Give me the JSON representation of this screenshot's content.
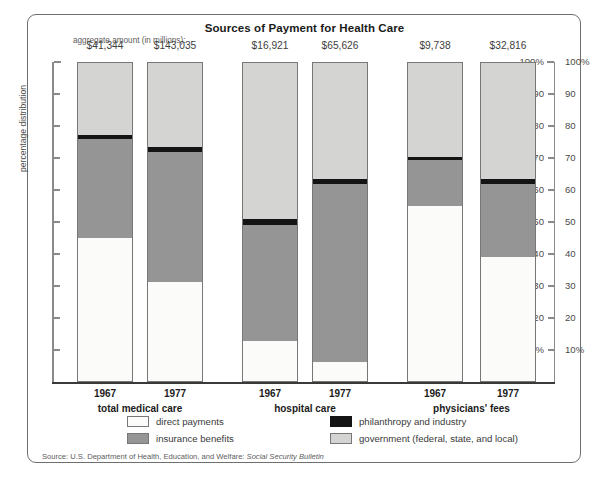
{
  "chart": {
    "title": "Sources of Payment for Health Care",
    "aggregate_label": "aggregate amount (in millions):",
    "ylabel": "percentage distribution",
    "source_prefix": "Source: U.S. Department of Health, Education, and Welfare: ",
    "source_italic": "Social Security Bulletin"
  },
  "axis": {
    "ticks": [
      "100%",
      "90",
      "80",
      "70",
      "60",
      "50",
      "40",
      "30",
      "20",
      "10%"
    ]
  },
  "groups": [
    {
      "name": "total medical care",
      "years": [
        "1967",
        "1977"
      ]
    },
    {
      "name": "hospital care",
      "years": [
        "1967",
        "1977"
      ]
    },
    {
      "name": "physicians' fees",
      "years": [
        "1967",
        "1977"
      ]
    }
  ],
  "legend": [
    {
      "key": "direct",
      "label": "direct payments",
      "color": "#fbfbfa"
    },
    {
      "key": "insurance",
      "label": "insurance benefits",
      "color": "#959595"
    },
    {
      "key": "phil",
      "label": "philanthropy and industry",
      "color": "#141414"
    },
    {
      "key": "gov",
      "label": "government (federal, state, and local)",
      "color": "#d4d4d2"
    }
  ],
  "chart_data": {
    "type": "bar",
    "subtype": "stacked-percentage",
    "title": "Sources of Payment for Health Care",
    "xlabel": "",
    "ylabel": "percentage distribution",
    "ylim": [
      0,
      100
    ],
    "ytick_labels": [
      "10%",
      "20",
      "30",
      "40",
      "50",
      "60",
      "70",
      "80",
      "90",
      "100%"
    ],
    "grid": false,
    "legend_position": "bottom",
    "categories": [
      "total medical care 1967",
      "total medical care 1977",
      "hospital care 1967",
      "hospital care 1977",
      "physicians' fees 1967",
      "physicians' fees 1977"
    ],
    "aggregate_amounts": [
      "$41,344",
      "$143,035",
      "$16,921",
      "$65,626",
      "$9,738",
      "$32,816"
    ],
    "series": [
      {
        "name": "direct payments",
        "values": [
          45.0,
          31.0,
          12.5,
          6.0,
          55.0,
          39.0
        ]
      },
      {
        "name": "insurance benefits",
        "values": [
          31.0,
          41.0,
          36.5,
          56.0,
          14.5,
          23.0
        ]
      },
      {
        "name": "philanthropy and industry",
        "values": [
          1.5,
          1.5,
          2.0,
          1.5,
          1.0,
          1.5
        ]
      },
      {
        "name": "government (federal, state, and local)",
        "values": [
          22.5,
          26.5,
          49.0,
          36.5,
          29.5,
          36.5
        ]
      }
    ],
    "bars": [
      {
        "group": "total medical care",
        "year": "1967",
        "amount": "$41,344",
        "direct": 45.0,
        "insurance": 31.0,
        "phil": 1.5,
        "gov": 22.5
      },
      {
        "group": "total medical care",
        "year": "1977",
        "amount": "$143,035",
        "direct": 31.0,
        "insurance": 41.0,
        "phil": 1.5,
        "gov": 26.5
      },
      {
        "group": "hospital care",
        "year": "1967",
        "amount": "$16,921",
        "direct": 12.5,
        "insurance": 36.5,
        "phil": 2.0,
        "gov": 49.0
      },
      {
        "group": "hospital care",
        "year": "1977",
        "amount": "$65,626",
        "direct": 6.0,
        "insurance": 56.0,
        "phil": 1.5,
        "gov": 36.5
      },
      {
        "group": "physicians' fees",
        "year": "1967",
        "amount": "$9,738",
        "direct": 55.0,
        "insurance": 14.5,
        "phil": 1.0,
        "gov": 29.5
      },
      {
        "group": "physicians' fees",
        "year": "1977",
        "amount": "$32,816",
        "direct": 39.0,
        "insurance": 23.0,
        "phil": 1.5,
        "gov": 36.5
      }
    ]
  }
}
